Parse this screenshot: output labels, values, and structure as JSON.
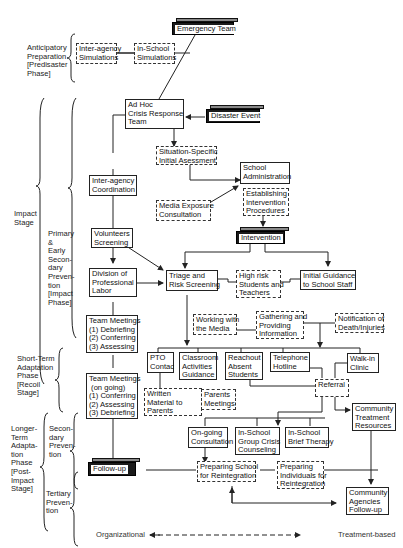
{
  "stages": {
    "anticipatory": "Anticipatory\nPreparation\n[Predisaster\nPhase]",
    "impact": "Impact\nStage",
    "primary": "Primary\n&\nEarly\nSecon-\ndary\nPreven-\ntion\n[Impact\nPhase]",
    "short_term": "Short-Term\nAdaptation\nPhase\n[Recoil\nStage]",
    "longer_term": "Longer-\nTerm\nAdapta-\ntion\nPhase\n[Post-\nImpact\nStage]",
    "secondary": "Secon-\ndary\nPreven-\ntion",
    "tertiary": "Tertiary\nPreven-\ntion"
  },
  "nodes": {
    "emergency_team": "Emergency Team",
    "interagency_sim": "Inter-agency\nSimulations",
    "inschool_sim": "In-School\nSimulations",
    "adhoc": "Ad Hoc\nCrisis Response\nTeam",
    "disaster_event": "Disaster Event",
    "situation_assessment": "Situation-Specific\nInitial Asessment",
    "school_admin": "School\nAdministration",
    "interagency_coord": "Inter-agency\nCoordination",
    "media_exposure": "Media Exposure\nConsultation",
    "establishing": "Establishing\nIntervention\nProcedures",
    "intervention": "Intervention",
    "volunteers": "Volunteers\nScreening",
    "division_labor": "Division of\nProfessional\nLabor",
    "triage": "Triage and\nRisk Screening",
    "high_risk": "High risk\nStudents and\nTeachers",
    "initial_guidance": "Initial Guidance\nto School Staff",
    "working_media": "Working with\nthe Media",
    "gathering_info": "Gathering and\nProviding\nInformation",
    "notification": "Notification of\nDeath/Injuries",
    "team_meetings_1": "Team Meetings\n(1) Debriefing\n(2) Conferring\n(3) Assessing",
    "pto": "PTO\nContac",
    "classroom": "Classroom\nActivities\nGuidance",
    "reachout": "Reachout\nAbsent\nStudents",
    "telephone": "Telephone\nHotline",
    "walkin": "Walk-in\nClinic",
    "team_meetings_2": "Team Meetings\n (on going)\n(1) Conferring\n(2) Assessing\n(3) Debriefing",
    "written_material": "Written\nMaterial to\nParents",
    "parents_meetings": "Parents\nMeetings",
    "referral": "Referral",
    "community_treatment": "Community\nTreatment\nResources",
    "ongoing_consult": "On-going\nConsultation",
    "group_crisis": "In-School\nGroup Crisis\nCounseling",
    "brief_therapy": "In-School\nBrief Therapy",
    "follow_up": "Follow-up",
    "preparing_school": "Preparing School\nfor Reintegration",
    "preparing_individuals": "Preparing\nIndividuals for\nReintegration",
    "community_agencies": "Community\nAgencies\nFollow-up"
  },
  "axis": {
    "left": "Organizational",
    "right": "Treatment-based"
  },
  "caption": "Fig. 10.1. Response to School-Based Disaster: Intervention Stages",
  "colors": {
    "line": "#222222",
    "dark_box": "#1a1a1a",
    "background": "#ffffff"
  }
}
